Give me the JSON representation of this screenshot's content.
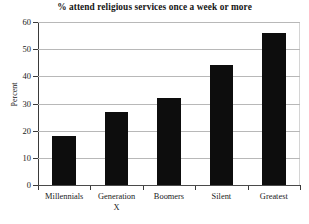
{
  "chart_data": {
    "type": "bar",
    "title": "% attend religious services once a week or more",
    "xlabel": "",
    "ylabel": "Percent",
    "categories": [
      "Millennials",
      "Generation X",
      "Boomers",
      "Silent",
      "Greatest"
    ],
    "category_lines": [
      [
        "Millennials"
      ],
      [
        "Generation",
        "X"
      ],
      [
        "Boomers"
      ],
      [
        "Silent"
      ],
      [
        "Greatest"
      ]
    ],
    "values": [
      18,
      27,
      32,
      44,
      56
    ],
    "ylim": [
      0,
      60
    ],
    "yticks": [
      0,
      10,
      20,
      30,
      40,
      50,
      60
    ],
    "ytick_labels": [
      "0",
      "10",
      "20",
      "30",
      "40",
      "50",
      "60"
    ],
    "grid": true,
    "legend": false,
    "bar_color": "#0d0d0d",
    "gridline_color": "#b8b8b8",
    "axis_color": "#3a3a3a",
    "background_color": "#ffffff"
  }
}
